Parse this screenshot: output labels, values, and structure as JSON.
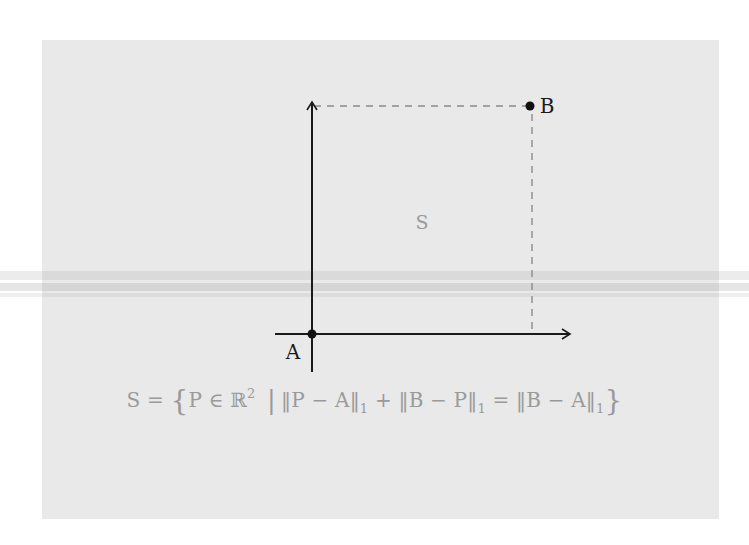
{
  "diagram": {
    "type": "geometry-figure",
    "colors": {
      "background": "#ffffff",
      "panel": "#e9e9e9",
      "axes": "#1a1a1a",
      "dashed_lines": "#8a8a8a",
      "region_label": "#9a9a9a",
      "formula": "#9a9a9a"
    },
    "axes": {
      "x_axis": {
        "from": [
          275,
          334
        ],
        "to": [
          572,
          334
        ],
        "arrow": true
      },
      "y_axis": {
        "from": [
          312,
          372
        ],
        "to": [
          312,
          100
        ],
        "arrow": true
      }
    },
    "points": [
      {
        "id": "A",
        "label": "A",
        "x": 312,
        "y": 334
      },
      {
        "id": "B",
        "label": "B",
        "x": 530,
        "y": 106
      }
    ],
    "dashed_lines": [
      {
        "from": [
          312,
          106
        ],
        "to": [
          530,
          106
        ]
      },
      {
        "from": [
          532,
          112
        ],
        "to": [
          532,
          334
        ]
      }
    ],
    "region": {
      "label": "S"
    },
    "formula": {
      "lhs": "S",
      "equals": "=",
      "open_brace": "{",
      "element": "P ∈ ℝ",
      "element_exponent": "2",
      "separator": "|",
      "term1": "‖P − A‖",
      "term1_sub": "1",
      "plus": "+",
      "term2": "‖B − P‖",
      "term2_sub": "1",
      "equals2": "=",
      "term3": "‖B − A‖",
      "term3_sub": "1",
      "close_brace": "}"
    }
  }
}
